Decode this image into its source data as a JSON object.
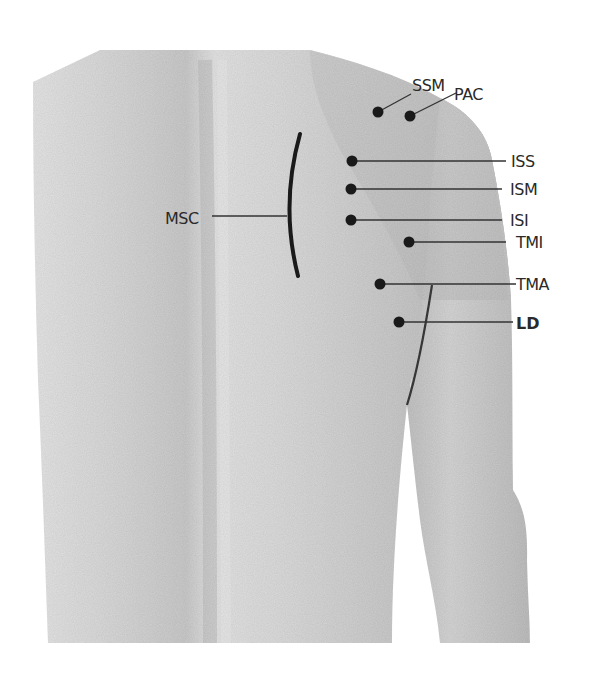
{
  "diagram": {
    "colors": {
      "background": "#ffffff",
      "skin_light": "#e2e2e2",
      "skin_mid": "#cfcfcf",
      "skin_dark": "#b4b4b4",
      "marker": "#1a1a1a",
      "label_text": "#2a2a2a"
    },
    "points": [
      {
        "id": "SSM",
        "label": "SSM",
        "dot": [
          378,
          112
        ],
        "line_end": [
          411,
          94
        ],
        "label_pos": [
          412,
          91
        ],
        "bold": false
      },
      {
        "id": "PAC",
        "label": "PAC",
        "dot": [
          410,
          116
        ],
        "line_end": [
          456,
          93
        ],
        "label_pos": [
          454,
          100
        ],
        "bold": false
      },
      {
        "id": "ISS",
        "label": "ISS",
        "dot": [
          352,
          161
        ],
        "line_end": [
          506,
          161
        ],
        "label_pos": [
          511,
          167
        ],
        "bold": false
      },
      {
        "id": "ISM",
        "label": "ISM",
        "dot": [
          351,
          189
        ],
        "line_end": [
          502,
          189
        ],
        "label_pos": [
          510,
          195
        ],
        "bold": false
      },
      {
        "id": "ISI",
        "label": "ISI",
        "dot": [
          351,
          220
        ],
        "line_end": [
          502,
          220
        ],
        "label_pos": [
          510,
          226
        ],
        "bold": false
      },
      {
        "id": "TMI",
        "label": "TMI",
        "dot": [
          409,
          242
        ],
        "line_end": [
          506,
          242
        ],
        "label_pos": [
          516,
          248
        ],
        "bold": false
      },
      {
        "id": "TMA",
        "label": "TMA",
        "dot": [
          380,
          284
        ],
        "line_end": [
          516,
          284
        ],
        "label_pos": [
          516,
          290
        ],
        "bold": false
      },
      {
        "id": "LD",
        "label": "LD",
        "dot": [
          399,
          322
        ],
        "line_end": [
          513,
          322
        ],
        "label_pos": [
          516,
          329
        ],
        "bold": true
      }
    ],
    "region": {
      "id": "MSC",
      "label": "MSC",
      "label_pos": [
        165,
        224
      ],
      "leader_start": [
        212,
        216
      ],
      "leader_end": [
        287,
        216
      ],
      "arc": {
        "top": [
          300,
          134
        ],
        "mid": [
          287,
          216
        ],
        "bottom": [
          298,
          276
        ]
      }
    }
  }
}
